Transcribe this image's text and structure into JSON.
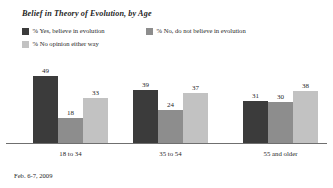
{
  "chart_data": {
    "type": "bar",
    "title": "Belief in Theory of Evolution, by Age",
    "xlabel": "",
    "ylabel": "",
    "ylim": [
      0,
      55
    ],
    "grid": false,
    "legend_position": "top-left",
    "categories": [
      "18 to 34",
      "35 to 54",
      "55 and older"
    ],
    "series": [
      {
        "name": "% Yes, believe in evolution",
        "color": "#3b3b3b",
        "values": [
          49,
          39,
          31
        ]
      },
      {
        "name": "% No, do not believe in evolution",
        "color": "#8d8d8d",
        "values": [
          18,
          24,
          30
        ]
      },
      {
        "name": "% No opinion either way",
        "color": "#c2c2c2",
        "values": [
          33,
          37,
          38
        ]
      }
    ],
    "annotations": {
      "footnote": "Feb. 6-7, 2009"
    }
  },
  "colors": {
    "axis": "#6f6f6f",
    "text": "#1f1f1f",
    "background": "#ffffff"
  }
}
